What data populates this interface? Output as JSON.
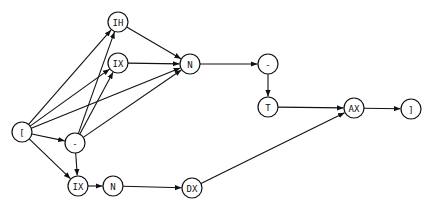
{
  "diagram": {
    "type": "directed-graph",
    "nodes": [
      {
        "id": "lbr",
        "label": "[",
        "x": 22,
        "y": 132,
        "r": 10
      },
      {
        "id": "ih",
        "label": "IH",
        "x": 118,
        "y": 22,
        "r": 10
      },
      {
        "id": "ix1",
        "label": "IX",
        "x": 118,
        "y": 63,
        "r": 10
      },
      {
        "id": "n1",
        "label": "N",
        "x": 190,
        "y": 64,
        "r": 10
      },
      {
        "id": "minus1",
        "label": "-",
        "x": 75,
        "y": 143,
        "r": 10
      },
      {
        "id": "ix2",
        "label": "IX",
        "x": 78,
        "y": 186,
        "r": 10
      },
      {
        "id": "n2",
        "label": "N",
        "x": 113,
        "y": 186,
        "r": 10
      },
      {
        "id": "dx",
        "label": "DX",
        "x": 192,
        "y": 188,
        "r": 10
      },
      {
        "id": "minus2",
        "label": "-",
        "x": 268,
        "y": 64,
        "r": 10
      },
      {
        "id": "t",
        "label": "T",
        "x": 268,
        "y": 107,
        "r": 10
      },
      {
        "id": "ax",
        "label": "AX",
        "x": 354,
        "y": 108,
        "r": 10
      },
      {
        "id": "rbr",
        "label": "]",
        "x": 411,
        "y": 109,
        "r": 10
      }
    ],
    "edges": [
      {
        "from": "lbr",
        "to": "ih"
      },
      {
        "from": "lbr",
        "to": "ix1"
      },
      {
        "from": "lbr",
        "to": "n1"
      },
      {
        "from": "lbr",
        "to": "minus1"
      },
      {
        "from": "lbr",
        "to": "ix2"
      },
      {
        "from": "minus1",
        "to": "ih"
      },
      {
        "from": "minus1",
        "to": "ix1"
      },
      {
        "from": "minus1",
        "to": "n1"
      },
      {
        "from": "minus1",
        "to": "ix2"
      },
      {
        "from": "ih",
        "to": "n1"
      },
      {
        "from": "ix1",
        "to": "n1"
      },
      {
        "from": "n1",
        "to": "minus2"
      },
      {
        "from": "minus2",
        "to": "t"
      },
      {
        "from": "t",
        "to": "ax"
      },
      {
        "from": "ax",
        "to": "rbr"
      },
      {
        "from": "ix2",
        "to": "n2"
      },
      {
        "from": "n2",
        "to": "dx"
      },
      {
        "from": "dx",
        "to": "ax"
      }
    ]
  }
}
